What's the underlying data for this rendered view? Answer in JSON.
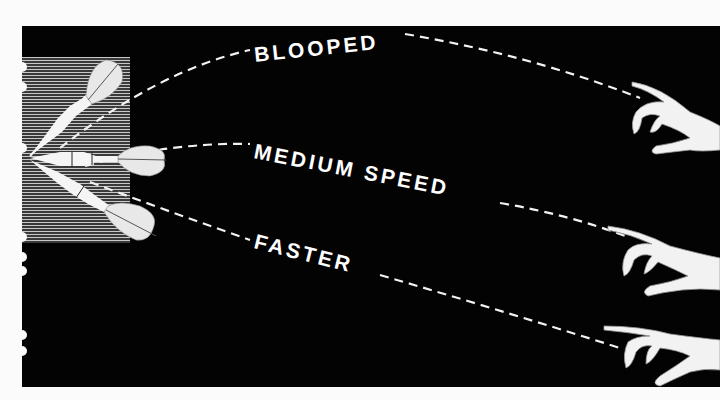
{
  "diagram": {
    "trajectories": [
      {
        "id": "blooped",
        "label": "BLOOPED"
      },
      {
        "id": "medium",
        "label": "MEDIUM SPEED"
      },
      {
        "id": "faster",
        "label": "FASTER"
      }
    ],
    "elements": {
      "darts": [
        "upper-dart",
        "middle-dart",
        "lower-dart"
      ],
      "hands": [
        "upper-hand",
        "middle-hand",
        "lower-hand"
      ]
    },
    "colors": {
      "background": "#030303",
      "foreground": "#ffffff",
      "paper": "#fbfbfb"
    }
  }
}
